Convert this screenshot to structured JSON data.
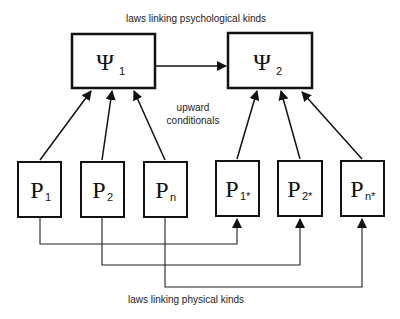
{
  "diagram": {
    "top_caption": "laws linking psychological kinds",
    "middle_caption": [
      "upward",
      "conditionals"
    ],
    "bottom_caption": "laws linking physical kinds",
    "psych_nodes": [
      {
        "id": "psi1",
        "symbol": "Ψ",
        "subscript": "1"
      },
      {
        "id": "psi2",
        "symbol": "Ψ",
        "subscript": "2"
      }
    ],
    "phys_nodes": [
      {
        "id": "p1",
        "symbol": "P",
        "subscript": "1"
      },
      {
        "id": "p2",
        "symbol": "P",
        "subscript": "2"
      },
      {
        "id": "pn",
        "symbol": "P",
        "subscript": "n"
      },
      {
        "id": "p1s",
        "symbol": "P",
        "subscript": "1*"
      },
      {
        "id": "p2s",
        "symbol": "P",
        "subscript": "2*"
      },
      {
        "id": "pns",
        "symbol": "P",
        "subscript": "n*"
      }
    ],
    "edges": [
      {
        "from": "psi1",
        "to": "psi2"
      },
      {
        "from": "p1",
        "to": "psi1"
      },
      {
        "from": "p2",
        "to": "psi1"
      },
      {
        "from": "pn",
        "to": "psi1"
      },
      {
        "from": "p1s",
        "to": "psi2"
      },
      {
        "from": "p2s",
        "to": "psi2"
      },
      {
        "from": "pns",
        "to": "psi2"
      },
      {
        "from": "p1",
        "to": "p1s"
      },
      {
        "from": "p2",
        "to": "p2s"
      },
      {
        "from": "pn",
        "to": "pns"
      }
    ]
  }
}
